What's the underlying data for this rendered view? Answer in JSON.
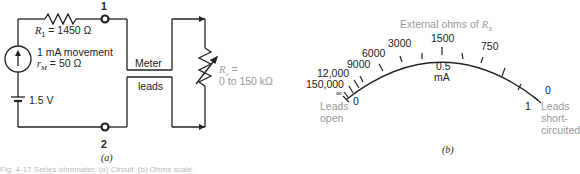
{
  "figure_a": {
    "label": "(a)",
    "terminal_1": "1",
    "terminal_2": "2",
    "resistor_label": "R",
    "resistor_sub": "1",
    "resistor_value": " = 1450 Ω",
    "movement_label": "1 mA movement",
    "rm_label": "r",
    "rm_sub": "M",
    "rm_value": " = 50 Ω",
    "battery_label": "1.5 V",
    "meter_label": "Meter",
    "leads_label": "leads",
    "rx_label": "R",
    "rx_sub": "x",
    "rx_eq": " =",
    "rx_range": "0 to 150 kΩ"
  },
  "figure_b": {
    "label": "(b)",
    "title": "External ohms of ",
    "title_var": "R",
    "title_sub": "X",
    "ohm_scale": [
      "150,000",
      "12,000",
      "9000",
      "6000",
      "3000",
      "1500",
      "750",
      "0"
    ],
    "infinity": "∞",
    "current_mid": "0.5",
    "current_unit": "mA",
    "current_min": "0",
    "current_max": "1",
    "left_note": [
      "Leads",
      "open"
    ],
    "right_note": [
      "Leads",
      "short-",
      "circuited"
    ]
  },
  "caption": "Fig. 4-17  Series ohmmeter. (a) Circuit. (b) Ohms scale."
}
